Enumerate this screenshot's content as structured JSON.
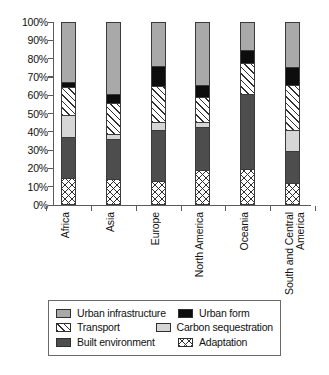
{
  "chart_data": {
    "type": "bar",
    "subtype": "stacked-percentage",
    "title": "",
    "xlabel": "",
    "ylabel": "",
    "ylim": [
      0,
      100
    ],
    "grid": false,
    "legend_position": "bottom",
    "categories": [
      "Africa",
      "Asia",
      "Europe",
      "North America",
      "Oceania",
      "South and Central\nAmerica"
    ],
    "ytick_labels": [
      "100%",
      "90%",
      "80%",
      "70%",
      "60%",
      "50%",
      "40%",
      "30%",
      "20%",
      "10%",
      "0%"
    ],
    "ytick_values": [
      100,
      90,
      80,
      70,
      60,
      50,
      40,
      30,
      20,
      10,
      0
    ],
    "stack_order_bottom_to_top": [
      "Adaptation",
      "Built environment",
      "Carbon sequestration",
      "Transport",
      "Urban form",
      "Urban infrastructure"
    ],
    "series": [
      {
        "name": "Adaptation",
        "key": "adaptation",
        "pattern": "cross-hatch",
        "color": "#ffffff",
        "values": [
          14,
          13.5,
          12,
          18.5,
          19,
          11
        ]
      },
      {
        "name": "Built environment",
        "key": "built-environment",
        "pattern": "solid",
        "color": "#4d4d4d",
        "values": [
          22.5,
          22,
          28.5,
          23.5,
          41,
          18
        ]
      },
      {
        "name": "Carbon sequestration",
        "key": "carbon-sequestration",
        "pattern": "solid",
        "color": "#d6d6d6",
        "values": [
          12,
          2.5,
          4,
          3,
          0,
          11.5
        ]
      },
      {
        "name": "Transport",
        "key": "transport",
        "pattern": "diagonal-hatch",
        "color": "#ffffff",
        "values": [
          15.5,
          17.5,
          20,
          13.5,
          17.5,
          24.5
        ]
      },
      {
        "name": "Urban form",
        "key": "urban-form",
        "pattern": "solid",
        "color": "#0d0d0d",
        "values": [
          3,
          4.5,
          11,
          6.5,
          7,
          10
        ]
      },
      {
        "name": "Urban infrastructure",
        "key": "urban-infrastructure",
        "pattern": "solid",
        "color": "#a9a9a9",
        "values": [
          33,
          40,
          24.5,
          35,
          15.5,
          25
        ]
      }
    ]
  },
  "legend": {
    "rows": [
      {
        "left": {
          "label": "Urban infrastructure",
          "key": "urban-infrastructure"
        },
        "right": {
          "label": "Urban form",
          "key": "urban-form"
        }
      },
      {
        "left": {
          "label": "Transport",
          "key": "transport"
        },
        "right": {
          "label": "Carbon sequestration",
          "key": "carbon-sequestration"
        }
      },
      {
        "left": {
          "label": "Built environment",
          "key": "built-environment"
        },
        "right": {
          "label": "Adaptation",
          "key": "adaptation"
        }
      }
    ]
  }
}
